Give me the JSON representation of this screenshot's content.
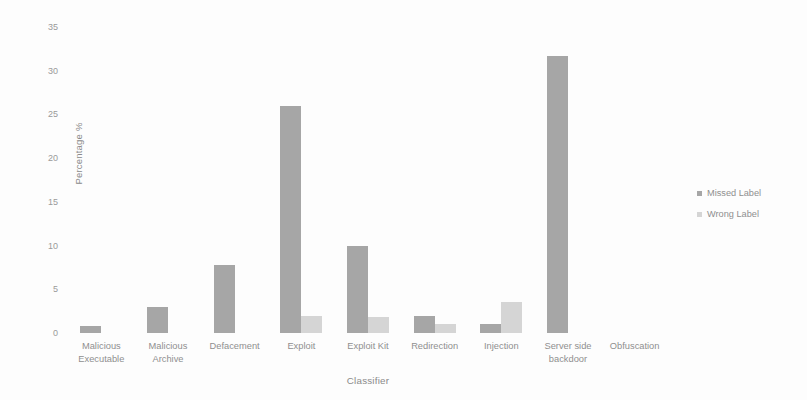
{
  "chart_data": {
    "type": "bar",
    "title": "",
    "xlabel": "Classifier",
    "ylabel": "Percentage %",
    "ylim": [
      0,
      35
    ],
    "yticks": [
      0,
      5,
      10,
      15,
      20,
      25,
      30,
      35
    ],
    "grid": false,
    "legend_position": "right",
    "categories": [
      "Malicious\nExecutable",
      "Malicious\nArchive",
      "Defacement",
      "Exploit",
      "Exploit Kit",
      "Redirection",
      "Injection",
      "Server side\nbackdoor",
      "Obfuscation"
    ],
    "series": [
      {
        "name": "Missed Label",
        "color": "#a6a6a6",
        "values": [
          0.8,
          3.0,
          7.8,
          26.0,
          10.0,
          2.0,
          1.0,
          31.7,
          0
        ]
      },
      {
        "name": "Wrong Label",
        "color": "#d5d5d5",
        "values": [
          0,
          0,
          0,
          2.0,
          1.8,
          1.0,
          3.5,
          0,
          0
        ]
      }
    ]
  },
  "legend": {
    "items": [
      {
        "label": "Missed Label",
        "color": "#a6a6a6"
      },
      {
        "label": "Wrong Label",
        "color": "#d5d5d5"
      }
    ]
  }
}
